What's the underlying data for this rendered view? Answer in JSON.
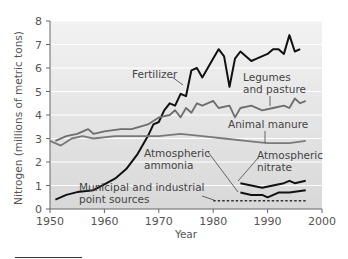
{
  "chart_data": {
    "type": "line",
    "title": "",
    "xlabel": "Year",
    "ylabel": "Nitrogen (millions of metric tons)",
    "xlim": [
      1950,
      2000
    ],
    "ylim": [
      0,
      8
    ],
    "x_ticks": [
      1950,
      1960,
      1970,
      1980,
      1990,
      2000
    ],
    "y_ticks": [
      0,
      1,
      2,
      3,
      4,
      5,
      6,
      7,
      8
    ],
    "grid": true,
    "legend": "none (inline annotations)",
    "series": [
      {
        "name": "Fertilizer",
        "label": "Fertilizer",
        "color": "#111111",
        "style": "solid",
        "x": [
          1951,
          1953,
          1955,
          1958,
          1960,
          1962,
          1964,
          1966,
          1968,
          1969,
          1970,
          1971,
          1972,
          1973,
          1974,
          1975,
          1976,
          1977,
          1978,
          1980,
          1981,
          1982,
          1983,
          1984,
          1985,
          1987,
          1988,
          1990,
          1991,
          1992,
          1993,
          1994,
          1995,
          1996
        ],
        "values": [
          0.4,
          0.6,
          0.72,
          0.8,
          1.05,
          1.3,
          1.7,
          2.3,
          3.1,
          3.6,
          3.7,
          4.2,
          4.5,
          4.4,
          4.9,
          4.8,
          5.9,
          6.0,
          5.6,
          6.4,
          6.8,
          6.5,
          5.2,
          6.4,
          6.7,
          6.3,
          6.4,
          6.6,
          6.8,
          6.8,
          6.6,
          7.4,
          6.7,
          6.8
        ]
      },
      {
        "name": "Legumes and pasture",
        "label": "Legumes and pasture",
        "color": "#6e6e6e",
        "style": "solid",
        "x": [
          1951,
          1953,
          1955,
          1957,
          1958,
          1960,
          1963,
          1965,
          1968,
          1970,
          1972,
          1973,
          1974,
          1975,
          1976,
          1977,
          1978,
          1980,
          1981,
          1983,
          1984,
          1985,
          1987,
          1989,
          1991,
          1993,
          1994,
          1995,
          1996,
          1997
        ],
        "values": [
          2.9,
          3.1,
          3.2,
          3.4,
          3.2,
          3.3,
          3.4,
          3.4,
          3.6,
          3.9,
          4.0,
          4.2,
          3.9,
          4.3,
          4.1,
          4.5,
          4.4,
          4.6,
          4.3,
          4.4,
          3.9,
          4.3,
          4.4,
          4.2,
          4.3,
          4.4,
          4.3,
          4.7,
          4.5,
          4.6
        ]
      },
      {
        "name": "Animal manure",
        "label": "Animal manure",
        "color": "#7a7a7a",
        "style": "solid",
        "x": [
          1950,
          1952,
          1954,
          1956,
          1958,
          1962,
          1966,
          1970,
          1974,
          1978,
          1982,
          1986,
          1990,
          1994,
          1997
        ],
        "values": [
          2.9,
          2.7,
          3.0,
          3.1,
          3.0,
          3.1,
          3.1,
          3.1,
          3.2,
          3.1,
          3.0,
          2.9,
          2.8,
          2.8,
          2.9
        ]
      },
      {
        "name": "Atmospheric nitrate",
        "label": "Atmospheric nitrate",
        "color": "#111111",
        "style": "solid",
        "x": [
          1985,
          1987,
          1989,
          1991,
          1993,
          1994,
          1995,
          1997
        ],
        "values": [
          1.1,
          1.0,
          0.9,
          1.0,
          1.1,
          1.2,
          1.1,
          1.2
        ]
      },
      {
        "name": "Atmospheric ammonia",
        "label": "Atmospheric ammonia",
        "color": "#111111",
        "style": "solid",
        "x": [
          1985,
          1987,
          1989,
          1990,
          1992,
          1994,
          1997
        ],
        "values": [
          0.7,
          0.6,
          0.6,
          0.5,
          0.7,
          0.7,
          0.8
        ]
      },
      {
        "name": "Municipal and industrial point sources",
        "label": "Municipal and industrial point sources",
        "color": "#333333",
        "style": "dashed",
        "x": [
          1980,
          1997
        ],
        "values": [
          0.35,
          0.35
        ]
      }
    ],
    "annotations": [
      {
        "text": "Fertilizer",
        "x": 1981,
        "y": 6.3
      },
      {
        "text": "Legumes\nand pasture",
        "x": 1989,
        "y": 5.6
      },
      {
        "text": "Animal manure",
        "x": 1987,
        "y": 3.4
      },
      {
        "text": "Atmospheric\nammonia",
        "x": 1976,
        "y": 1.9
      },
      {
        "text": "Atmospheric\nnitrate",
        "x": 1990,
        "y": 1.4
      },
      {
        "text": "Municipal and industrial\npoint sources",
        "x": 1965,
        "y": 0.6
      }
    ],
    "colors": {
      "plot_background_top": "#f1f1f1",
      "plot_background_bottom": "#d9d9d9",
      "gridline": "#ffffff",
      "axis": "#666666"
    }
  },
  "labels": {
    "xlabel": "Year",
    "ylabel": "Nitrogen (millions of metric tons)",
    "fertilizer": "Fertilizer",
    "legumes_1": "Legumes",
    "legumes_2": "and pasture",
    "manure": "Animal manure",
    "ammonia_1": "Atmospheric",
    "ammonia_2": "ammonia",
    "nitrate_1": "Atmospheric",
    "nitrate_2": "nitrate",
    "municipal_1": "Municipal and industrial",
    "municipal_2": "point sources"
  }
}
